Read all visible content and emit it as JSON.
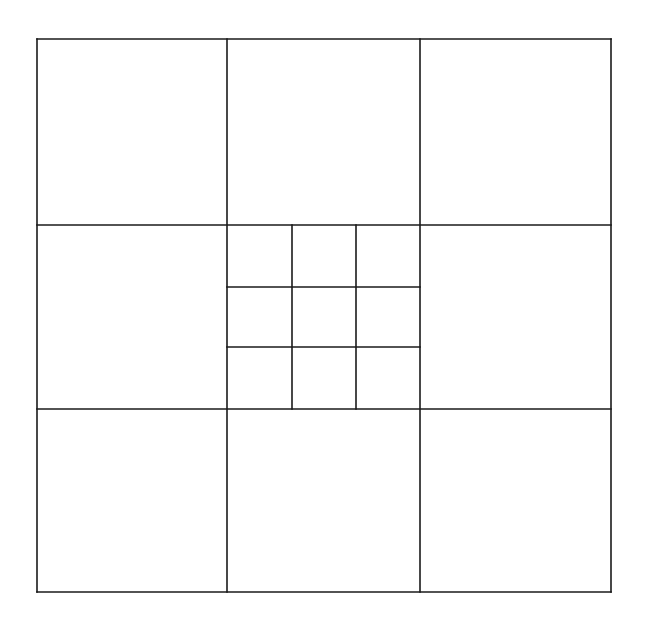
{
  "diagram": {
    "outer_grid": {
      "rows": 3,
      "cols": 3
    },
    "subdivided_cell": {
      "row": 1,
      "col": 1,
      "rows": 3,
      "cols": 3
    },
    "line_color": "#1a1a1a",
    "background_color": "#ffffff"
  }
}
